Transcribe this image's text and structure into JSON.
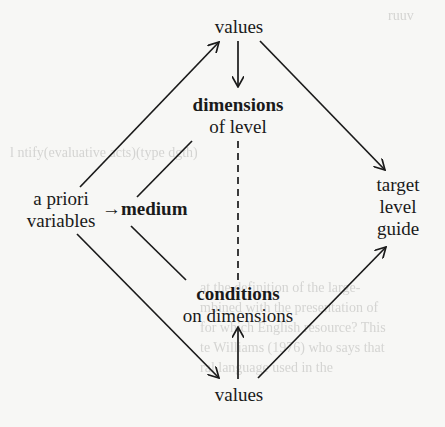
{
  "diagram": {
    "nodes": {
      "values_top": {
        "label": "values"
      },
      "dimensions": {
        "line1": "dimensions",
        "line2": "of level"
      },
      "a_priori": {
        "line1": "a priori",
        "line2": "variables"
      },
      "medium": {
        "label": "medium",
        "arrow": "→"
      },
      "target": {
        "line1": "target",
        "line2": "level",
        "line3": "guide"
      },
      "conditions": {
        "line1": "conditions",
        "line2": "on dimensions"
      },
      "values_bottom": {
        "label": "values"
      }
    },
    "edges": [
      {
        "from": "a priori variables",
        "to": "values (top)",
        "style": "arrow"
      },
      {
        "from": "values (top)",
        "to": "dimensions of level",
        "style": "arrow"
      },
      {
        "from": "values (top)",
        "to": "target level guide",
        "style": "arrow"
      },
      {
        "from": "a priori variables",
        "to": "medium",
        "style": "arrow"
      },
      {
        "from": "medium",
        "to": "dimensions of level",
        "style": "line"
      },
      {
        "from": "medium",
        "to": "conditions on dimensions",
        "style": "line"
      },
      {
        "from": "dimensions of level",
        "to": "conditions on dimensions",
        "style": "dashed"
      },
      {
        "from": "a priori variables",
        "to": "values (bottom)",
        "style": "arrow"
      },
      {
        "from": "values (bottom)",
        "to": "conditions on dimensions",
        "style": "arrow"
      },
      {
        "from": "values (bottom)",
        "to": "target level guide",
        "style": "arrow"
      }
    ],
    "colors": {
      "ink": "#1a1a1a",
      "paper": "#f7f7f5"
    }
  },
  "background_bleed": {
    "line1": "ruuv",
    "line2": "l                              ntify(evaluative acts)(type dgth)",
    "line3": "at the definition of the large-",
    "line4": "mbined with the presentation of",
    "line5": "for which English resource? This",
    "line6": "te Williams (1976) who says that",
    "line7": "           ral language used in the"
  }
}
